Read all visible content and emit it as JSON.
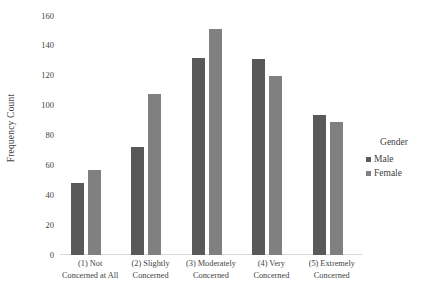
{
  "chart_data": {
    "type": "bar",
    "title": "",
    "xlabel": "",
    "ylabel": "Frequency Count",
    "ylim": [
      0,
      160
    ],
    "yticks": [
      0,
      20,
      40,
      60,
      80,
      100,
      120,
      140,
      160
    ],
    "grid": false,
    "legend_position": "right",
    "legend_title": "Gender",
    "categories": [
      "(1) Not Concerned at All",
      "(2) Slightly Concerned",
      "(3) Moderately Concerned",
      "(4) Very Concerned",
      "(5) Extremely Concerned"
    ],
    "category_lines": [
      {
        "line1": "(1) Not",
        "line2": "Concerned at All"
      },
      {
        "line1": "(2) Slightly",
        "line2": "Concerned"
      },
      {
        "line1": "(3) Moderately",
        "line2": "Concerned"
      },
      {
        "line1": "(4) Very",
        "line2": "Concerned"
      },
      {
        "line1": "(5) Extremely",
        "line2": "Concerned"
      }
    ],
    "series": [
      {
        "name": "Male",
        "color": "#595959",
        "values": [
          48,
          72,
          132,
          131,
          94
        ]
      },
      {
        "name": "Female",
        "color": "#808080",
        "values": [
          57,
          108,
          151,
          120,
          89
        ]
      }
    ]
  }
}
